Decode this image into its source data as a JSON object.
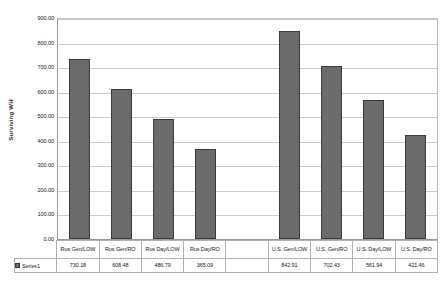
{
  "chart_data": {
    "type": "bar",
    "title": "",
    "xlabel": "",
    "ylabel": "Surviving WH",
    "ylim": [
      0,
      900
    ],
    "ytick_step": 100,
    "grid": true,
    "legend_position": "data-table",
    "bar_color": "#6b6b6b",
    "bar_border_color": "#3a3a3a",
    "categories": [
      "Rus Gen/LOW",
      "Rus Gen/RO",
      "Rus Day/LOW",
      "Rus Day/RO",
      "",
      "U.S. Gen/LOW",
      "U.S. Gen/RO",
      "U.S. Day/LOW",
      "U.S. Day/RO"
    ],
    "series": [
      {
        "name": "Series1",
        "values": [
          730.18,
          608.48,
          486.79,
          365.09,
          null,
          842.91,
          702.43,
          561.94,
          421.46
        ]
      }
    ],
    "value_labels": [
      "730.18",
      "608.48",
      "486.79",
      "365.09",
      "",
      "842.91",
      "702.43",
      "561.94",
      "421.46"
    ],
    "ytick_labels": [
      "900.00",
      "800.00",
      "700.00",
      "600.00",
      "500.00",
      "400.00",
      "300.00",
      "200.00",
      "100.00",
      "0.00"
    ]
  },
  "legend": {
    "series_label": "Series1"
  }
}
